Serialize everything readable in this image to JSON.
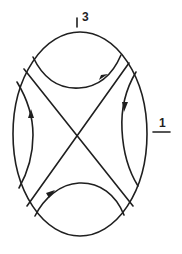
{
  "diagram": {
    "type": "phase-portrait",
    "stroke_color": "#1f1f1f",
    "background_color": "#ffffff",
    "labels": {
      "top": "3",
      "right": "1"
    },
    "boundary": {
      "shape": "ellipse",
      "cx": 80,
      "cy": 131,
      "rx": 67,
      "ry": 100
    },
    "separatrices": [
      {
        "name": "diagonal-descending",
        "from": [
          24,
          69
        ],
        "to": [
          133,
          205
        ]
      },
      {
        "name": "diagonal-ascending",
        "from": [
          129,
          63
        ],
        "to": [
          27,
          206
        ]
      }
    ],
    "trajectories": [
      {
        "name": "top",
        "arrow_direction": "right"
      },
      {
        "name": "right",
        "arrow_direction": "down"
      },
      {
        "name": "left",
        "arrow_direction": "up"
      },
      {
        "name": "bottom",
        "arrow_direction": "up-right"
      }
    ]
  }
}
